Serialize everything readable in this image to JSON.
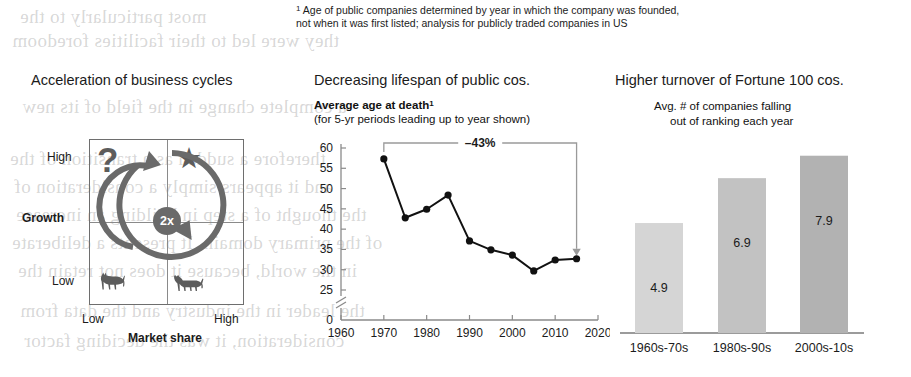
{
  "footnote": {
    "marker": "1",
    "line1": " Age of public companies determined by year in which the company was founded,",
    "line2": "not when it was first listed; analysis for publicly traded companies in US"
  },
  "matrix_panel": {
    "title": "Acceleration of business cycles",
    "y_axis_label": "Growth",
    "y_high": "High",
    "y_low": "Low",
    "x_axis_label": "Market share",
    "x_low": "Low",
    "x_high": "High",
    "quadrants": {
      "top_left_icon": "question-mark-icon",
      "top_right_icon": "star-icon",
      "bottom_left_icon": "dog-icon",
      "bottom_right_icon": "cow-icon"
    },
    "question_mark": "?",
    "star_glyph": "★",
    "dog_glyph": "🐕",
    "cow_glyph": "🐄",
    "cycle_badge": "2x",
    "cycle_icon": "circular-arrow-icon"
  },
  "line_panel": {
    "title": "Decreasing lifespan of public cos.",
    "subtitle_bold": "Average age at death",
    "subtitle_marker": "1",
    "subtitle": "(for 5-yr periods leading up to year shown)"
  },
  "bar_panel": {
    "title": "Higher turnover of Fortune 100 cos.",
    "subtitle_line1": "Avg. # of companies falling",
    "subtitle_line2": "out of ranking each year"
  },
  "colors": {
    "ink": "#1b1b1b",
    "gray_icon": "#5c5c5c",
    "axis": "#8a8a8a",
    "bar1": "#d5d5d5",
    "bar2": "#c2c2c2",
    "bar3": "#b2b2b2",
    "annotation": "#9a9a9a"
  },
  "bleed_text": [
    {
      "t": "most particularly to the",
      "x": 20,
      "y": 6
    },
    {
      "t": "they were led to their facilities foredoom",
      "x": 12,
      "y": 30
    },
    {
      "t": "a complete change in the field of its new",
      "x": 22,
      "y": 96
    },
    {
      "t": "therefore a sudden as a transition of the",
      "x": 10,
      "y": 148
    },
    {
      "t": "and it appears simply a consideration of",
      "x": 14,
      "y": 176
    },
    {
      "t": "the thought of a step in building an increase",
      "x": 16,
      "y": 204
    },
    {
      "t": "of the primary domain. It presents a deliberate",
      "x": 12,
      "y": 232
    },
    {
      "t": "in the world, because it does not retain the",
      "x": 18,
      "y": 260
    },
    {
      "t": "the leader in the industry and the data from",
      "x": 20,
      "y": 300
    },
    {
      "t": "consideration, it was the deciding factor",
      "x": 24,
      "y": 330
    }
  ],
  "chart_data": [
    {
      "type": "line",
      "title": "Average age at death",
      "subtitle": "(for 5-yr periods leading up to year shown)",
      "xlabel": "",
      "ylabel": "",
      "x": [
        1970,
        1975,
        1980,
        1985,
        1990,
        1995,
        2000,
        2005,
        2010,
        2015
      ],
      "values": [
        57.3,
        42.8,
        44.9,
        48.4,
        37.1,
        34.9,
        33.6,
        29.7,
        32.4,
        32.7
      ],
      "xlim": [
        1960,
        2020
      ],
      "ylim": [
        25,
        60
      ],
      "y_ticks": [
        0,
        25,
        30,
        35,
        40,
        45,
        50,
        55,
        60
      ],
      "y_tick_labels": [
        "0",
        "25",
        "30",
        "35",
        "40",
        "45",
        "50",
        "55",
        "60"
      ],
      "x_ticks": [
        1960,
        1970,
        1980,
        1990,
        2000,
        2010,
        2020
      ],
      "x_tick_labels": [
        "1960",
        "1970",
        "1980",
        "1990",
        "2000",
        "2010",
        "2020"
      ],
      "axis_break": true,
      "grid": false,
      "legend": "none",
      "annotations": [
        {
          "text": "–43%",
          "from_x": 1970,
          "to_x": 2015,
          "kind": "bracket-arrow"
        }
      ]
    },
    {
      "type": "bar",
      "title": "Avg. # of companies falling out of ranking each year",
      "categories": [
        "1960s-70s",
        "1980s-90s",
        "2000s-10s"
      ],
      "values": [
        4.9,
        6.9,
        7.9
      ],
      "value_labels": [
        "4.9",
        "6.9",
        "7.9"
      ],
      "bar_colors": [
        "#d5d5d5",
        "#c2c2c2",
        "#b2b2b2"
      ],
      "xlabel": "",
      "ylabel": "",
      "ylim": [
        0,
        8.6
      ],
      "grid": false,
      "legend": "none"
    }
  ]
}
